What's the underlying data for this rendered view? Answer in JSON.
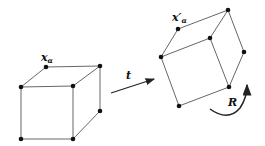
{
  "labels": {
    "x_alpha": "x",
    "x_alpha_sub": "α",
    "x_alpha_prime": "x′",
    "x_alpha_prime_sub": "α",
    "translation": "t",
    "rotation": "R"
  },
  "colors": {
    "edge": "#555555",
    "vertex": "#111111",
    "arrow": "#222222"
  }
}
